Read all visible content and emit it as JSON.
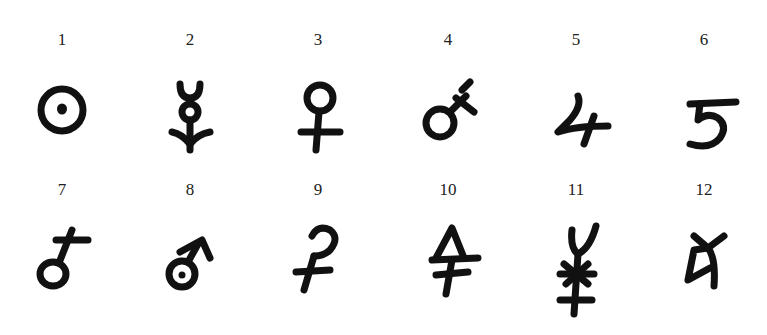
{
  "figure": {
    "symbols": [
      {
        "number": "1",
        "name": "circle-with-dot"
      },
      {
        "number": "2",
        "name": "crescent-circle-arrow"
      },
      {
        "number": "3",
        "name": "venus"
      },
      {
        "number": "4",
        "name": "mars-cross"
      },
      {
        "number": "5",
        "name": "jupiter"
      },
      {
        "number": "6",
        "name": "saturn"
      },
      {
        "number": "7",
        "name": "circle-cross-diagonal"
      },
      {
        "number": "8",
        "name": "circle-dot-arrow"
      },
      {
        "number": "9",
        "name": "hook-double-cross"
      },
      {
        "number": "10",
        "name": "triangle-cross"
      },
      {
        "number": "11",
        "name": "horns-star-cross"
      },
      {
        "number": "12",
        "name": "angular-hook"
      }
    ]
  }
}
